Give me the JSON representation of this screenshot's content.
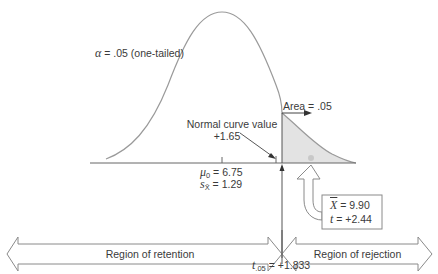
{
  "diagram": {
    "type": "one-tailed t-test normal curve",
    "alpha_label": {
      "symbol": "α",
      "text": " = .05 (one-tailed)"
    },
    "area_label": "Area = .05",
    "normal_curve_value": {
      "line1": "Normal curve value",
      "line2": "+1.65"
    },
    "mean_label": {
      "symbol": "μ",
      "sub": "0",
      "text": " = 6.75"
    },
    "se_label": {
      "symbol": "s",
      "sub": "X̄",
      "text": " = 1.29"
    },
    "sample_box": {
      "xbar_symbol": "X",
      "xbar_text": " = 9.90",
      "t_symbol": "t",
      "t_text": " = +2.44"
    },
    "regions": {
      "retention": "Region of retention",
      "rejection": "Region of rejection"
    },
    "critical_value": {
      "symbol": "t",
      "sub": ".05",
      "text": " = +1.833"
    },
    "colors": {
      "curve": "#9a9a9a",
      "line": "#555555",
      "shade": "#e2e2e2",
      "dot": "#c8c8c8",
      "arrow": "#8a8a8a"
    }
  }
}
